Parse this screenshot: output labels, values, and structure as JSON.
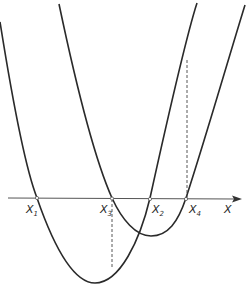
{
  "figure": {
    "axis": {
      "label": "X"
    },
    "roots": [
      {
        "id": "x1",
        "base": "X",
        "sub": "1"
      },
      {
        "id": "x3",
        "base": "X",
        "sub": "3"
      },
      {
        "id": "x2",
        "base": "X",
        "sub": "2"
      },
      {
        "id": "x4",
        "base": "X",
        "sub": "4"
      }
    ],
    "curves": [
      {
        "name": "parabola-1",
        "roots": [
          "x1",
          "x2"
        ],
        "description": "deeper parabola, roots X1 and X2"
      },
      {
        "name": "parabola-2",
        "roots": [
          "x3",
          "x4"
        ],
        "description": "shallower parabola shifted right, roots X3 and X4"
      }
    ],
    "guides": [
      {
        "name": "dashed-guide-x3",
        "at": "x3",
        "description": "from X3 down to parabola 1"
      },
      {
        "name": "dashed-guide-x4",
        "at": "x4",
        "description": "from X4 up to parabola 1"
      }
    ],
    "colors": {
      "stroke": "#2a2a2a",
      "background": "#ffffff"
    }
  }
}
